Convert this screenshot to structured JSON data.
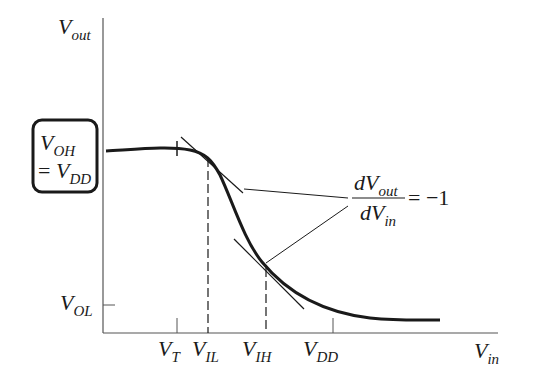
{
  "diagram": {
    "axes": {
      "y_label": {
        "main": "V",
        "sub": "out"
      },
      "x_label": {
        "main": "V",
        "sub": "in"
      }
    },
    "y_ticks": [
      {
        "id": "voh",
        "line1_main": "V",
        "line1_sub": "OH",
        "line2_prefix": "= ",
        "line2_main": "V",
        "line2_sub": "DD",
        "boxed": true
      },
      {
        "id": "vol",
        "main": "V",
        "sub": "OL"
      }
    ],
    "x_ticks": [
      {
        "id": "vt",
        "main": "V",
        "sub": "T"
      },
      {
        "id": "vil",
        "main": "V",
        "sub": "IL"
      },
      {
        "id": "vih",
        "main": "V",
        "sub": "IH"
      },
      {
        "id": "vdd",
        "main": "V",
        "sub": "DD"
      }
    ],
    "annotation": {
      "numerator_d": "d",
      "numerator_main": "V",
      "numerator_sub": "out",
      "denominator_d": "d",
      "denominator_main": "V",
      "denominator_sub": "in",
      "equals": "= −1"
    },
    "colors": {
      "line": "#1a1a1a",
      "axis": "#555555",
      "background": "#ffffff"
    }
  }
}
